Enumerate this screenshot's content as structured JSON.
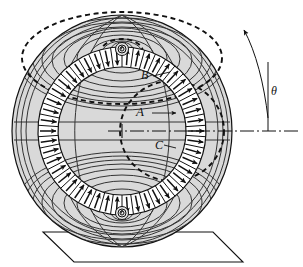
{
  "figure": {
    "background_color": "#ffffff",
    "line_color": "#111111",
    "sphere_fill": "#d9d9d9",
    "band_fill": "#ffffff",
    "width": 303,
    "height": 267
  },
  "labels": {
    "a": "A",
    "b": "B",
    "c": "C",
    "theta": "θ"
  },
  "geometry": {
    "center_x": 122,
    "center_y": 131,
    "sphere_rx": 110,
    "sphere_ry": 116,
    "band_outer_r": 84,
    "band_inner_r": 64,
    "arrow_count": 46,
    "field_loop_count": 9,
    "dashed_loop_b_label": "B",
    "dashed_loop_c_label": "C"
  },
  "annotations": {
    "rotation_arrow": "curved-arrow-counterclockwise",
    "axis_line_style": "dash-dot",
    "pole_marker_top": "spiral-pole",
    "pole_marker_bottom": "spiral-pole",
    "base_shape": "trapezoid-stand"
  }
}
